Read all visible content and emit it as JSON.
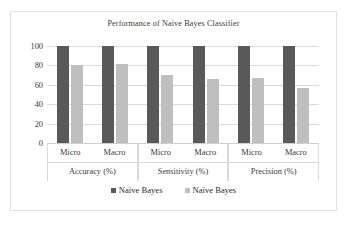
{
  "chart_data": {
    "type": "bar",
    "title": "Performance of Naive Bayes Classifier",
    "xlabel": "",
    "ylabel": "",
    "ylim": [
      0,
      100
    ],
    "yticks": [
      "0",
      "20",
      "40",
      "60",
      "80",
      "100"
    ],
    "grid": true,
    "legend_position": "bottom",
    "categories": [
      "Micro",
      "Macro",
      "Micro",
      "Macro",
      "Micro",
      "Macro"
    ],
    "group_labels": [
      "Accuracy (%)",
      "Sensitivity (%)",
      "Precision (%)"
    ],
    "groups": [
      {
        "label": "Accuracy (%)",
        "subcategories": [
          "Micro",
          "Macro"
        ],
        "values": [
          [
            100,
            80
          ],
          [
            100,
            81
          ]
        ]
      },
      {
        "label": "Sensitivity (%)",
        "subcategories": [
          "Micro",
          "Macro"
        ],
        "values": [
          [
            100,
            70
          ],
          [
            100,
            66
          ]
        ]
      },
      {
        "label": "Precision (%)",
        "subcategories": [
          "Micro",
          "Macro"
        ],
        "values": [
          [
            100,
            67
          ],
          [
            100,
            57
          ]
        ]
      }
    ],
    "series": [
      {
        "name": "Naïve Bayes",
        "color": "#595959",
        "values": [
          100,
          100,
          100,
          100,
          100,
          100
        ]
      },
      {
        "name": "Naïve Bayes",
        "color": "#bfbfbf",
        "values": [
          80,
          81,
          70,
          66,
          67,
          57
        ]
      }
    ]
  },
  "legend": {
    "items": [
      {
        "label": "Naïve Bayes",
        "color": "#595959"
      },
      {
        "label": "Naïve Bayes",
        "color": "#bfbfbf"
      }
    ]
  },
  "colors": {
    "series_dark": "#595959",
    "series_light": "#bfbfbf",
    "gridline": "#d9d9d9",
    "border": "#e2e2e2",
    "background": "#ffffff",
    "text": "#3a3a3a"
  }
}
